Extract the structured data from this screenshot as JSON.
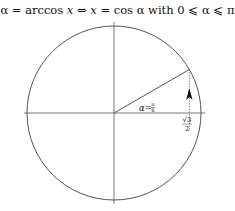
{
  "title": {
    "lhs": "α = arccos",
    "var_x": "x",
    "iff": " ⇔ ",
    "var_x2": "x",
    "rhs": " = cos α with 0 ⩽ α ⩽ π"
  },
  "diagram": {
    "angle_label_prefix": "α=",
    "angle_num": "π",
    "angle_den": "6",
    "angle_degrees": 30,
    "cos_label_num": "√3",
    "cos_label_den": "2",
    "colors": {
      "axis": "#777777",
      "circle": "#555555",
      "radius": "#555555",
      "projection": "#666666",
      "arrow": "#111111"
    }
  }
}
